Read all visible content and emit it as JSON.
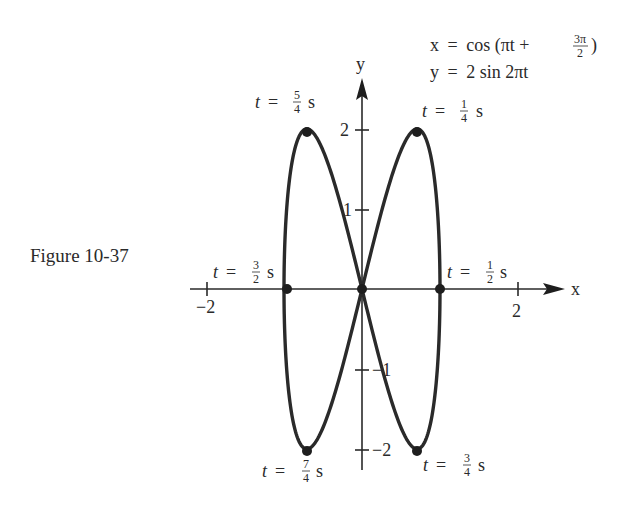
{
  "figure": {
    "caption": "Figure 10-37",
    "equations": {
      "x_lhs": "x",
      "x_eq": "=",
      "x_rhs_prefix": "cos (πt +",
      "x_frac_num": "3π",
      "x_frac_den": "2",
      "x_rhs_suffix": ")",
      "y_lhs": "y",
      "y_eq": "=",
      "y_rhs": "2 sin 2πt"
    },
    "axes": {
      "x_label": "x",
      "y_label": "y",
      "x_ticks": [
        {
          "value": -2,
          "label": "−2"
        },
        {
          "value": 2,
          "label": "2"
        }
      ],
      "y_ticks": [
        {
          "value": 2,
          "label": "2"
        },
        {
          "value": 1,
          "label": "1"
        },
        {
          "value": -1,
          "label": "−1"
        },
        {
          "value": -2,
          "label": "−2"
        }
      ]
    },
    "point_labels": {
      "t_5_4": {
        "t": "t",
        "eq": "=",
        "num": "5",
        "den": "4",
        "unit": "s"
      },
      "t_1_4": {
        "t": "t",
        "eq": "=",
        "num": "1",
        "den": "4",
        "unit": "s"
      },
      "t_3_2": {
        "t": "t",
        "eq": "=",
        "num": "3",
        "den": "2",
        "unit": "s"
      },
      "t_1_2": {
        "t": "t",
        "eq": "=",
        "num": "1",
        "den": "2",
        "unit": "s"
      },
      "t_7_4": {
        "t": "t",
        "eq": "=",
        "num": "7",
        "den": "4",
        "unit": "s"
      },
      "t_3_4": {
        "t": "t",
        "eq": "=",
        "num": "3",
        "den": "4",
        "unit": "s"
      }
    }
  },
  "chart_data": {
    "type": "line",
    "title": "Figure 10-37",
    "subtitle": "x = cos(πt + 3π/2), y = 2 sin 2πt",
    "xlabel": "x",
    "ylabel": "y",
    "xlim": [
      -2.3,
      2.6
    ],
    "ylim": [
      -2.3,
      2.6
    ],
    "grid": false,
    "legend": null,
    "x_ticks": [
      -2,
      2
    ],
    "y_ticks": [
      -2,
      -1,
      1,
      2
    ],
    "series": [
      {
        "name": "parametric curve (Lissajous figure-eight)",
        "parametric": {
          "x": "cos(πt + 3π/2) = sin(πt)",
          "y": "2 sin(2πt)",
          "t_range": [
            0,
            2
          ]
        },
        "x": [
          0,
          0.383,
          0.707,
          0.924,
          1,
          0.924,
          0.707,
          0.383,
          0,
          -0.383,
          -0.707,
          -0.924,
          -1,
          -0.924,
          -0.707,
          -0.383,
          0
        ],
        "y": [
          0,
          1.414,
          2,
          1.414,
          0,
          -1.414,
          -2,
          -1.414,
          0,
          1.414,
          2,
          1.414,
          0,
          -1.414,
          -2,
          -1.414,
          0
        ]
      }
    ],
    "annotations": [
      {
        "text": "t = 1/4 s",
        "x": 0.707,
        "y": 2
      },
      {
        "text": "t = 1/2 s",
        "x": 1,
        "y": 0
      },
      {
        "text": "t = 3/4 s",
        "x": 0.707,
        "y": -2
      },
      {
        "text": "t = 5/4 s",
        "x": -0.707,
        "y": 2
      },
      {
        "text": "t = 3/2 s",
        "x": -1,
        "y": 0
      },
      {
        "text": "t = 7/4 s",
        "x": -0.707,
        "y": -2
      }
    ],
    "marked_points": [
      {
        "x": 0.707,
        "y": 2
      },
      {
        "x": 1,
        "y": 0
      },
      {
        "x": 0.707,
        "y": -2
      },
      {
        "x": -0.707,
        "y": 2
      },
      {
        "x": -1,
        "y": 0
      },
      {
        "x": -0.707,
        "y": -2
      },
      {
        "x": 0,
        "y": 0
      }
    ]
  }
}
